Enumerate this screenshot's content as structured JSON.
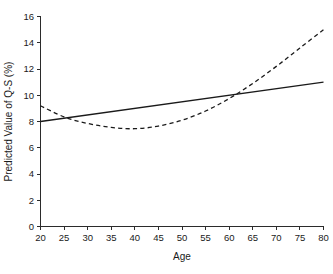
{
  "chart_data": {
    "type": "line",
    "title": "",
    "xlabel": "Age",
    "ylabel": "Predicted Value of Q-S (%)",
    "xlim": [
      20,
      80
    ],
    "ylim": [
      0,
      16
    ],
    "xticks": [
      20,
      25,
      30,
      35,
      40,
      45,
      50,
      55,
      60,
      65,
      70,
      75,
      80
    ],
    "yticks": [
      0,
      2,
      4,
      6,
      8,
      10,
      12,
      14,
      16
    ],
    "xtick_labels": [
      "20",
      "25",
      "30",
      "35",
      "40",
      "45",
      "50",
      "55",
      "60",
      "65",
      "70",
      "75",
      "80"
    ],
    "ytick_labels": [
      "0",
      "2",
      "4",
      "6",
      "8",
      "10",
      "12",
      "14",
      "16"
    ],
    "grid": false,
    "legend": "none",
    "line_color": "#1a1a1a",
    "series": [
      {
        "name": "linear-fit",
        "style": "solid",
        "x": [
          20,
          25,
          30,
          35,
          40,
          45,
          50,
          55,
          60,
          65,
          70,
          75,
          80
        ],
        "values": [
          8.0,
          8.25,
          8.5,
          8.75,
          9.0,
          9.25,
          9.5,
          9.75,
          10.0,
          10.25,
          10.5,
          10.75,
          11.0
        ]
      },
      {
        "name": "quadratic-fit",
        "style": "dashed",
        "x": [
          20,
          25,
          30,
          35,
          40,
          45,
          50,
          55,
          60,
          65,
          70,
          75,
          80
        ],
        "values": [
          9.2,
          8.35,
          7.85,
          7.55,
          7.45,
          7.65,
          8.1,
          8.8,
          9.75,
          10.9,
          12.2,
          13.6,
          15.0
        ]
      }
    ]
  },
  "figure": {
    "background_color": "#ffffff",
    "axis_color": "#2b2b2b"
  }
}
